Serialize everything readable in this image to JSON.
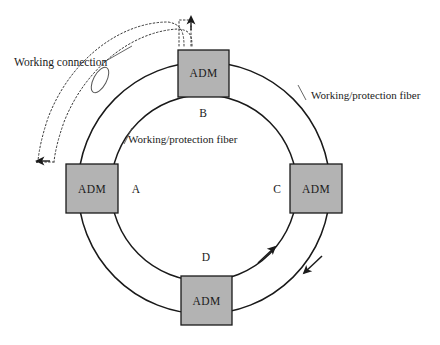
{
  "diagram": {
    "background_color": "#ffffff",
    "node_fill_color": "#b3b3b3",
    "node_stroke_color": "#1a1a1a",
    "line_color": "#1a1a1a",
    "dotted_line_color": "#555555"
  },
  "nodes": [
    {
      "id": "top",
      "device_label": "ADM",
      "letter": "B",
      "x": 203,
      "y": 73,
      "width": 51,
      "height": 47,
      "letter_x": 203,
      "letter_y": 113,
      "letter_anchor": "middle"
    },
    {
      "id": "left",
      "device_label": "ADM",
      "letter": "A",
      "x": 92,
      "y": 188,
      "width": 52,
      "height": 49,
      "letter_x": 136,
      "letter_y": 192,
      "letter_anchor": "middle"
    },
    {
      "id": "right",
      "device_label": "ADM",
      "letter": "C",
      "x": 316,
      "y": 188,
      "width": 52,
      "height": 49,
      "letter_x": 277,
      "letter_y": 192,
      "letter_anchor": "middle"
    },
    {
      "id": "bottom",
      "device_label": "ADM",
      "letter": "D",
      "x": 206,
      "y": 300,
      "width": 51,
      "height": 49,
      "letter_x": 206,
      "letter_y": 257,
      "letter_anchor": "middle"
    }
  ],
  "ring": {
    "center_x": 204,
    "center_y": 188,
    "outer_radius": 126,
    "inner_radius": 93
  },
  "labels": [
    {
      "id": "working-connection",
      "text": "Working connection",
      "x": 14,
      "y": 66,
      "anchor": "start"
    },
    {
      "id": "inner-fiber",
      "text": "Working/protection fiber",
      "x": 128,
      "y": 143,
      "anchor": "start"
    },
    {
      "id": "outer-fiber",
      "text": "Working/protection fiber",
      "x": 311,
      "y": 99,
      "anchor": "start"
    }
  ],
  "arrows": {
    "inner_ring_direction": "counter-clockwise-up-right",
    "outer_ring_direction": "clockwise-down-left",
    "working_connection_up_arrow": "up",
    "working_connection_left_arrow": "left"
  },
  "icons": {
    "pointer_ellipse": "ellipse-marker-icon",
    "arrowhead": "arrowhead-icon"
  }
}
